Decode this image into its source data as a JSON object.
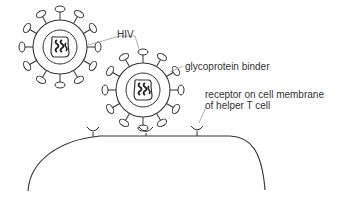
{
  "diagram": {
    "labels": {
      "hiv": "HIV",
      "glycoprotein": "glycoprotein binder",
      "receptor_line1": "receptor on cell membrane",
      "receptor_line2": "of helper T cell"
    },
    "elements": [
      {
        "name": "hiv-virus-1",
        "type": "virus"
      },
      {
        "name": "hiv-virus-2",
        "type": "virus",
        "bound_to": "receptor"
      },
      {
        "name": "helper-t-cell",
        "type": "cell-membrane"
      },
      {
        "name": "receptor",
        "count": 3
      }
    ],
    "colors": {
      "line": "#333333",
      "leader": "#999999"
    }
  }
}
